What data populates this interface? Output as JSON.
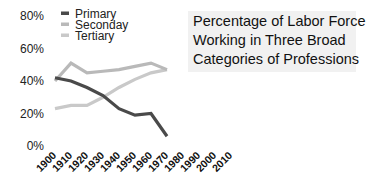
{
  "chart_data": {
    "type": "line",
    "title": "Percentage of Labor Force Working in Three Broad Categories of Professions",
    "title_lines": [
      "Percentage of Labor Force",
      "Working in Three Broad",
      "Categories of Professions"
    ],
    "xlabel": "",
    "ylabel": "",
    "x": [
      "1900",
      "1910",
      "1920",
      "1930",
      "1940",
      "1950",
      "1960",
      "1970"
    ],
    "x_tick_labels": [
      "1900",
      "1910",
      "1920",
      "1930",
      "1940",
      "1950",
      "1960",
      "1970",
      "1980",
      "1990",
      "2000",
      "2010"
    ],
    "y_tick_labels": [
      "0%",
      "20%",
      "40%",
      "60%",
      "80%"
    ],
    "ylim": [
      0,
      80
    ],
    "grid": false,
    "legend_position": "top-left",
    "series": [
      {
        "name": "Primary",
        "color": "#4a4a4a",
        "values": [
          42,
          40,
          36,
          31,
          23,
          19,
          20,
          6
        ]
      },
      {
        "name": "Seconday",
        "color": "#b9b9b9",
        "values": [
          40,
          51,
          45,
          46,
          47,
          49,
          51,
          47
        ]
      },
      {
        "name": "Tertiary",
        "color": "#c9c9c9",
        "values": [
          23,
          25,
          25,
          30,
          36,
          41,
          45,
          47
        ]
      }
    ]
  }
}
